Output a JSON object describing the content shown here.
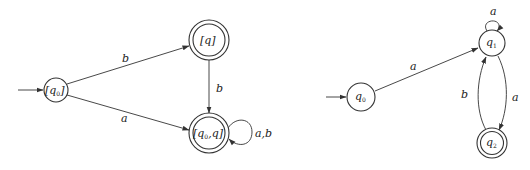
{
  "diagrams": [
    {
      "name": "left-dfa",
      "states": [
        {
          "id": "s0",
          "label": "[q",
          "sub": "0",
          "suffix": "]",
          "start": true,
          "accepting": false
        },
        {
          "id": "s1",
          "label": "[q]",
          "sub": "",
          "suffix": "",
          "start": false,
          "accepting": true
        },
        {
          "id": "s2",
          "label": "[q",
          "sub": "0",
          "suffix": ",q]",
          "start": false,
          "accepting": true
        }
      ],
      "transitions": [
        {
          "from": "s0",
          "to": "s1",
          "label": "b"
        },
        {
          "from": "s0",
          "to": "s2",
          "label": "a"
        },
        {
          "from": "s1",
          "to": "s2",
          "label": "b"
        },
        {
          "from": "s2",
          "to": "s2",
          "label": "a,b"
        }
      ]
    },
    {
      "name": "right-dfa",
      "states": [
        {
          "id": "r0",
          "label": "q",
          "sub": "0",
          "start": true,
          "accepting": false
        },
        {
          "id": "r1",
          "label": "q",
          "sub": "1",
          "start": false,
          "accepting": false
        },
        {
          "id": "r2",
          "label": "q",
          "sub": "2",
          "start": false,
          "accepting": true
        }
      ],
      "transitions": [
        {
          "from": "r0",
          "to": "r1",
          "label": "a"
        },
        {
          "from": "r1",
          "to": "r1",
          "label": "a"
        },
        {
          "from": "r1",
          "to": "r2",
          "label": "a"
        },
        {
          "from": "r2",
          "to": "r1",
          "label": "b"
        }
      ]
    }
  ]
}
